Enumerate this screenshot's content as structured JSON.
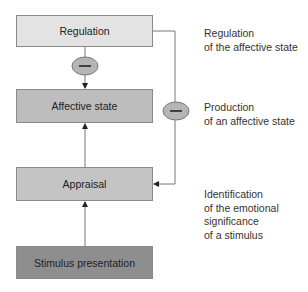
{
  "diagram": {
    "boxes": [
      {
        "id": "regulation",
        "label": "Regulation",
        "fill": "#e3e3e3"
      },
      {
        "id": "affective_state",
        "label": "Affective state",
        "fill": "#bdbdbd"
      },
      {
        "id": "appraisal",
        "label": "Appraisal",
        "fill": "#c4c4c4"
      },
      {
        "id": "stimulus_presentation",
        "label": "Stimulus presentation",
        "fill": "#8e8e8e"
      }
    ],
    "descriptions": [
      {
        "for": "regulation",
        "lines": [
          "Regulation",
          "of the affective state"
        ]
      },
      {
        "for": "affective_state",
        "lines": [
          "Production",
          "of an affective state"
        ]
      },
      {
        "for": "appraisal",
        "lines": [
          "Identification",
          "of the emotional",
          "significance",
          "of a stimulus"
        ]
      }
    ],
    "inhibitors": [
      {
        "between": "regulation -> affective_state",
        "symbol": "minus"
      },
      {
        "between": "regulation -> appraisal",
        "symbol": "minus"
      }
    ],
    "arrows": [
      "stimulus_presentation -> appraisal",
      "appraisal -> affective_state",
      "regulation -> affective_state (inhibitory)",
      "regulation -> appraisal (inhibitory feedback)"
    ]
  }
}
